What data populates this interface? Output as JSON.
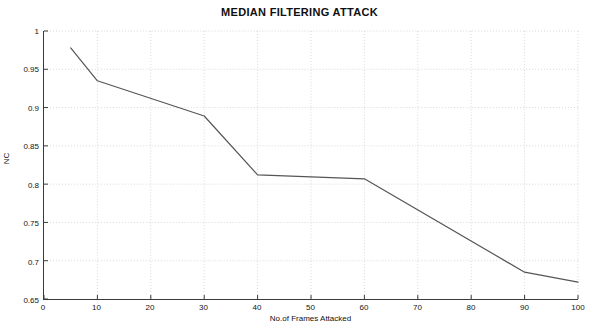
{
  "chart_data": {
    "type": "line",
    "title": "MEDIAN FILTERING ATTACK",
    "xlabel": "No.of Frames Attacked",
    "ylabel": "NC",
    "xlim": [
      0,
      100
    ],
    "ylim": [
      0.65,
      1
    ],
    "xticks": [
      0,
      10,
      20,
      30,
      40,
      50,
      60,
      70,
      80,
      90,
      100
    ],
    "xtick_labels": [
      "0",
      "10",
      "20",
      "30",
      "40",
      "50",
      "60",
      "70",
      "80",
      "90",
      "100"
    ],
    "yticks": [
      0.65,
      0.7,
      0.75,
      0.8,
      0.85,
      0.9,
      0.95,
      1
    ],
    "ytick_labels": [
      "0.65",
      "0.7",
      "0.75",
      "0.8",
      "0.85",
      "0.9",
      "0.95",
      "1"
    ],
    "grid": true,
    "grid_style": "dotted",
    "grid_color": "#d8d8d8",
    "legend": null,
    "line_color": "#555555",
    "line_width": 1.2,
    "x": [
      5,
      10,
      30,
      40,
      60,
      90,
      100
    ],
    "y": [
      0.978,
      0.935,
      0.889,
      0.812,
      0.807,
      0.685,
      0.672
    ],
    "series": [
      {
        "name": "NC",
        "points": [
          {
            "x": 5,
            "y": 0.978
          },
          {
            "x": 10,
            "y": 0.935
          },
          {
            "x": 30,
            "y": 0.889
          },
          {
            "x": 40,
            "y": 0.812
          },
          {
            "x": 60,
            "y": 0.807
          },
          {
            "x": 90,
            "y": 0.685
          },
          {
            "x": 100,
            "y": 0.672
          }
        ]
      }
    ]
  },
  "figure": {
    "background": "#ffffff",
    "axis_color": "#3a3a3a"
  }
}
